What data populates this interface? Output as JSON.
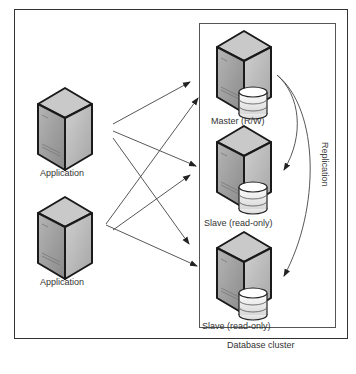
{
  "nodes": {
    "app1": {
      "label": "Application"
    },
    "app2": {
      "label": "Application"
    },
    "master": {
      "label": "Master (R/W)"
    },
    "slave1": {
      "label": "Slave (read-only)"
    },
    "slave2": {
      "label": "Slave (read-only)"
    }
  },
  "cluster": {
    "label": "Database cluster"
  },
  "replication": {
    "label": "Replication"
  },
  "icons": {
    "application": "server-icon",
    "database_server": "server-with-database-icon"
  },
  "colors": {
    "line": "#444444",
    "server_front": "#9a9a9a",
    "server_side": "#bdbdbd",
    "server_top": "#cfcfcf"
  }
}
